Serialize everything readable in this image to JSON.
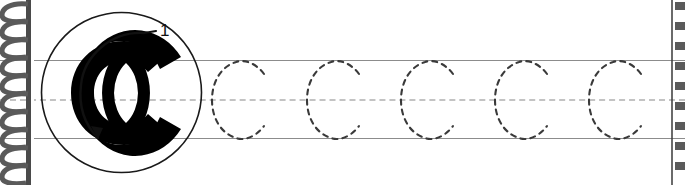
{
  "worksheet": {
    "title": "Letter C handwriting tracing worksheet",
    "letter": "C",
    "letter_case": "uppercase",
    "stroke_order_label": "1",
    "stroke_count": 1,
    "stroke_direction": "counterclockwise",
    "instruction_hidden": "Trace the letter C"
  },
  "model": {
    "letter_glyph": "C",
    "circle_name": "model-letter-circle",
    "arrow_name": "stroke-1-arrow",
    "number_label": "1"
  },
  "guidelines": {
    "top_label": "top line",
    "middle_label": "dashed midline",
    "bottom_label": "baseline",
    "top_y": 60,
    "middle_y": 99,
    "bottom_y": 138,
    "solid_color": "#8c8c8c",
    "dashed_color": "#c3c3c3"
  },
  "tracing": {
    "count": 5,
    "glyph": "C",
    "stroke_style": "dashed",
    "stroke_color": "#3a3a3a",
    "letters": [
      {
        "index": 1,
        "label": "C",
        "x": 206
      },
      {
        "index": 2,
        "label": "C",
        "x": 301
      },
      {
        "index": 3,
        "label": "C",
        "x": 395
      },
      {
        "index": 4,
        "label": "C",
        "x": 489
      },
      {
        "index": 5,
        "label": "C",
        "x": 583
      }
    ]
  },
  "binding": {
    "type": "spiral-coil",
    "coil_count": 10,
    "color": "#5a5a5a",
    "spine_color": "#4a4a4a"
  },
  "perforation": {
    "type": "tear-edge",
    "tick_count": 9,
    "color": "#5a5a5a",
    "line_color": "#3a3a3a"
  },
  "colors": {
    "page": "#ffffff",
    "ink": "#000000",
    "guide": "#8c8c8c",
    "guide_dashed": "#c3c3c3",
    "trace_ink": "#3a3a3a",
    "binding": "#5a5a5a"
  }
}
